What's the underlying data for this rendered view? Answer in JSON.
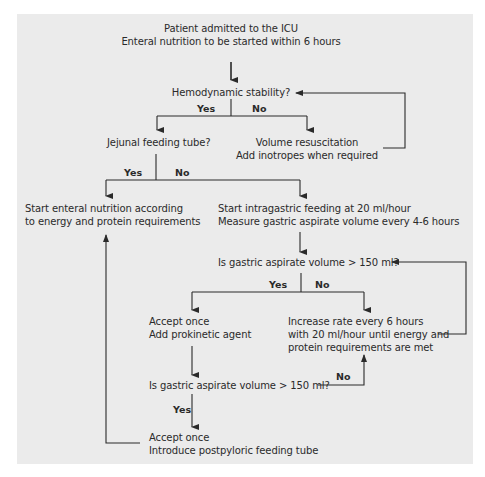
{
  "colors": {
    "panel_background": "#ebebeb",
    "page_background": "#ffffff",
    "line": "#2a2a2a",
    "text": "#2a2a2a"
  },
  "nodes": {
    "start": {
      "line1": "Patient admitted to the ICU",
      "line2": "Enteral nutrition to be started within 6 hours"
    },
    "hemodynamic_question": {
      "text": "Hemodynamic stability?"
    },
    "jejunal_question": {
      "text": "Jejunal feeding tube?"
    },
    "volume_resuscitation": {
      "line1": "Volume resuscitation",
      "line2": "Add inotropes when required"
    },
    "start_enteral": {
      "line1": "Start enteral nutrition according",
      "line2": "to energy and protein requirements"
    },
    "start_intragastric": {
      "line1": "Start intragastric feeding at 20 ml/hour",
      "line2": "Measure gastric aspirate volume every 4-6 hours"
    },
    "gastric_question_1": {
      "text": "Is gastric aspirate volume > 150 ml?"
    },
    "accept_prokinetic": {
      "line1": "Accept once",
      "line2": "Add prokinetic agent"
    },
    "increase_rate": {
      "line1": "Increase rate every 6 hours",
      "line2": "with 20 ml/hour until energy and",
      "line3": "protein requirements are met"
    },
    "gastric_question_2": {
      "text": "Is gastric aspirate volume > 150 ml?"
    },
    "accept_postpyloric": {
      "line1": "Accept once",
      "line2": "Introduce postpyloric feeding tube"
    }
  },
  "edge_labels": {
    "hemo_yes": "Yes",
    "hemo_no": "No",
    "jejunal_yes": "Yes",
    "jejunal_no": "No",
    "gastric1_yes": "Yes",
    "gastric1_no": "No",
    "gastric2_no": "No",
    "gastric2_yes": "Yes"
  }
}
